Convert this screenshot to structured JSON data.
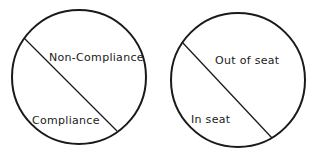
{
  "diagrams": [
    {
      "upper_label": "Non-Compliance",
      "lower_label": "Compliance"
    },
    {
      "upper_label": "Out of seat",
      "lower_label": "In seat"
    }
  ],
  "colors": {
    "stroke": "#1a1a1a",
    "background": "#ffffff"
  }
}
